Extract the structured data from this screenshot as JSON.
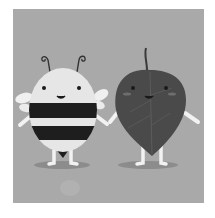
{
  "image": {
    "description": "Grayscale cartoon illustration of a smiling bee and a smiling leaf standing side by side holding hands",
    "characters": [
      {
        "name": "bee",
        "features": [
          "antennae",
          "striped body",
          "wings",
          "smiling face"
        ]
      },
      {
        "name": "leaf",
        "features": [
          "stem",
          "veins",
          "rosy cheeks",
          "smiling face"
        ]
      }
    ]
  },
  "colors": {
    "background": "#a9a9a9",
    "bee_body": "#e6e6e6",
    "bee_stripe": "#1e1e1e",
    "leaf": "#4a4a4a",
    "limbs": "#f2f2f2",
    "shadow": "#8c8c8c"
  }
}
